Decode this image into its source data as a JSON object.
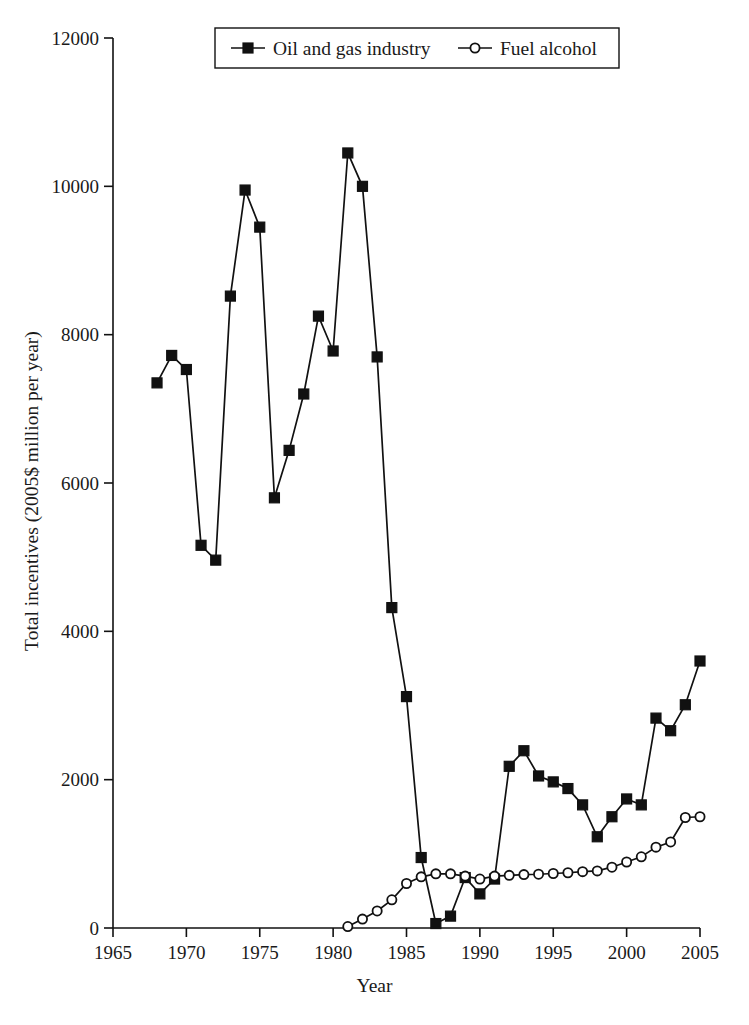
{
  "chart_data": {
    "type": "line",
    "title": "",
    "xlabel": "Year",
    "ylabel": "Total incentives (2005$ million per year)",
    "xlim": [
      1965,
      2005
    ],
    "ylim": [
      0,
      12000
    ],
    "xticks": [
      1965,
      1970,
      1975,
      1980,
      1985,
      1990,
      1995,
      2000,
      2005
    ],
    "yticks": [
      0,
      2000,
      4000,
      6000,
      8000,
      10000,
      12000
    ],
    "grid": false,
    "legend_position": "top-center",
    "series": [
      {
        "name": "Oil and gas industry",
        "marker": "filled-square",
        "color": "#111111",
        "x": [
          1968,
          1969,
          1970,
          1971,
          1972,
          1973,
          1974,
          1975,
          1976,
          1977,
          1978,
          1979,
          1980,
          1981,
          1982,
          1983,
          1984,
          1985,
          1986,
          1987,
          1988,
          1989,
          1990,
          1991,
          1992,
          1993,
          1994,
          1995,
          1996,
          1997,
          1998,
          1999,
          2000,
          2001,
          2002,
          2003,
          2004,
          2005
        ],
        "values": [
          7350,
          7720,
          7530,
          5160,
          4960,
          8520,
          9950,
          9450,
          5800,
          6440,
          7200,
          8250,
          7780,
          10450,
          10000,
          7700,
          4320,
          3120,
          950,
          60,
          160,
          680,
          460,
          660,
          2180,
          2390,
          2050,
          1970,
          1880,
          1660,
          1230,
          1500,
          1740,
          1660,
          2830,
          2660,
          3010,
          3600
        ]
      },
      {
        "name": "Fuel alcohol",
        "marker": "open-circle",
        "color": "#111111",
        "x": [
          1981,
          1982,
          1983,
          1984,
          1985,
          1986,
          1987,
          1988,
          1989,
          1990,
          1991,
          1992,
          1993,
          1994,
          1995,
          1996,
          1997,
          1998,
          1999,
          2000,
          2001,
          2002,
          2003,
          2004,
          2005
        ],
        "values": [
          20,
          120,
          230,
          380,
          600,
          690,
          730,
          730,
          700,
          660,
          700,
          710,
          720,
          725,
          735,
          745,
          760,
          770,
          820,
          890,
          960,
          1090,
          1160,
          1490,
          1500
        ]
      }
    ]
  },
  "legend": {
    "entries": [
      {
        "label": "Oil and gas industry",
        "marker": "filled-square"
      },
      {
        "label": "Fuel alcohol",
        "marker": "open-circle"
      }
    ]
  },
  "axes": {
    "y_title": "Total incentives (2005$ million per year)",
    "x_title": "Year",
    "y_tick_labels": [
      "0",
      "2000",
      "4000",
      "6000",
      "8000",
      "10000",
      "12000"
    ],
    "x_tick_labels": [
      "1965",
      "1970",
      "1975",
      "1980",
      "1985",
      "1990",
      "1995",
      "2000",
      "2005"
    ]
  }
}
